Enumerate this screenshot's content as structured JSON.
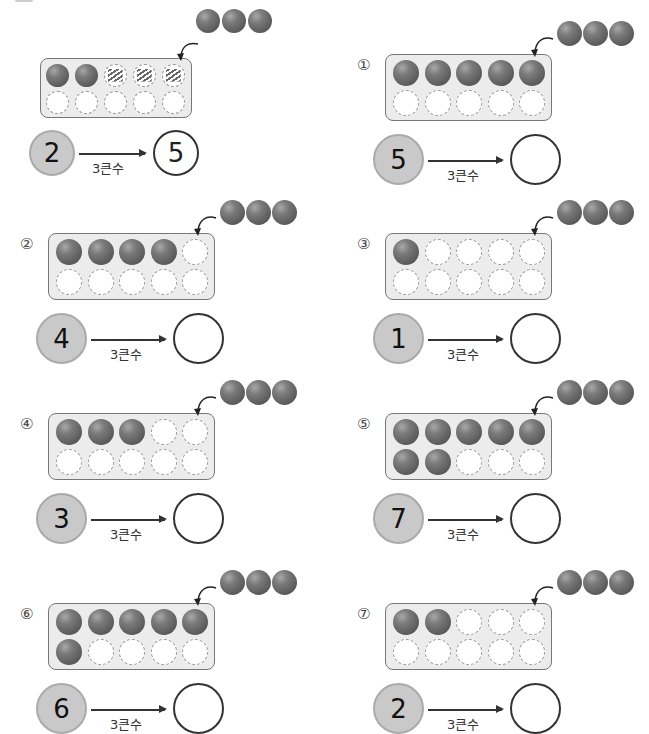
{
  "worksheet": {
    "rule_label": "3큰수",
    "example": {
      "label": "",
      "start_number": "2",
      "answer": "5",
      "cells_filled": 2,
      "cells_hatched": 3
    },
    "problems": [
      {
        "label": "①",
        "start_number": "5",
        "answer": "",
        "cells_filled": 5
      },
      {
        "label": "②",
        "start_number": "4",
        "answer": "",
        "cells_filled": 4
      },
      {
        "label": "③",
        "start_number": "1",
        "answer": "",
        "cells_filled": 1
      },
      {
        "label": "④",
        "start_number": "3",
        "answer": "",
        "cells_filled": 3
      },
      {
        "label": "⑤",
        "start_number": "7",
        "answer": "",
        "cells_filled": 7
      },
      {
        "label": "⑥",
        "start_number": "6",
        "answer": "",
        "cells_filled": 6
      },
      {
        "label": "⑦",
        "start_number": "2",
        "answer": "",
        "cells_filled": 2
      }
    ],
    "extra_balls": 3,
    "colors": {
      "ball": "#6a6a6a",
      "frame_fill": "#ececec",
      "frame_border": "#777777",
      "number_circle_fill": "#c9c9c9",
      "answer_circle_border": "#333333"
    }
  }
}
